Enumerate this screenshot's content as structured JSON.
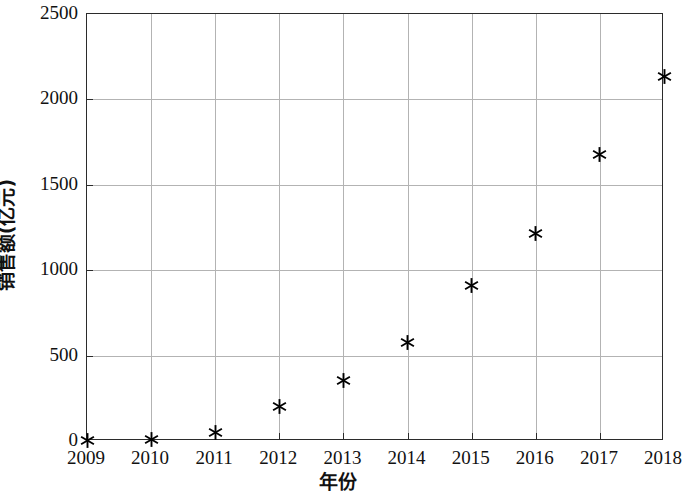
{
  "chart_data": {
    "type": "scatter",
    "title": "",
    "xlabel": "年份",
    "ylabel": "销售额(亿元)",
    "categories": [
      "2009",
      "2010",
      "2011",
      "2012",
      "2013",
      "2014",
      "2015",
      "2016",
      "2017",
      "2018"
    ],
    "x": [
      2009,
      2010,
      2011,
      2012,
      2013,
      2014,
      2015,
      2016,
      2017,
      2018
    ],
    "values": [
      5,
      10,
      47,
      200,
      353,
      575,
      912,
      1212,
      1676,
      2135
    ],
    "series": [
      {
        "name": "销售额",
        "values": [
          5,
          10,
          47,
          200,
          353,
          575,
          912,
          1212,
          1676,
          2135
        ]
      }
    ],
    "xlim": [
      2009,
      2018
    ],
    "ylim": [
      0,
      2500
    ],
    "xticks": [
      "2009",
      "2010",
      "2011",
      "2012",
      "2013",
      "2014",
      "2015",
      "2016",
      "2017",
      "2018"
    ],
    "yticks": [
      "0",
      "500",
      "1000",
      "1500",
      "2000",
      "2500"
    ],
    "ytick_values": [
      0,
      500,
      1000,
      1500,
      2000,
      2500
    ],
    "grid": true,
    "legend": false,
    "legend_position": "none",
    "marker": "asterisk",
    "marker_color": "#000000",
    "grid_color": "#b3b3b3",
    "axis_color": "#2b2b2b",
    "background_color": "#ffffff"
  }
}
